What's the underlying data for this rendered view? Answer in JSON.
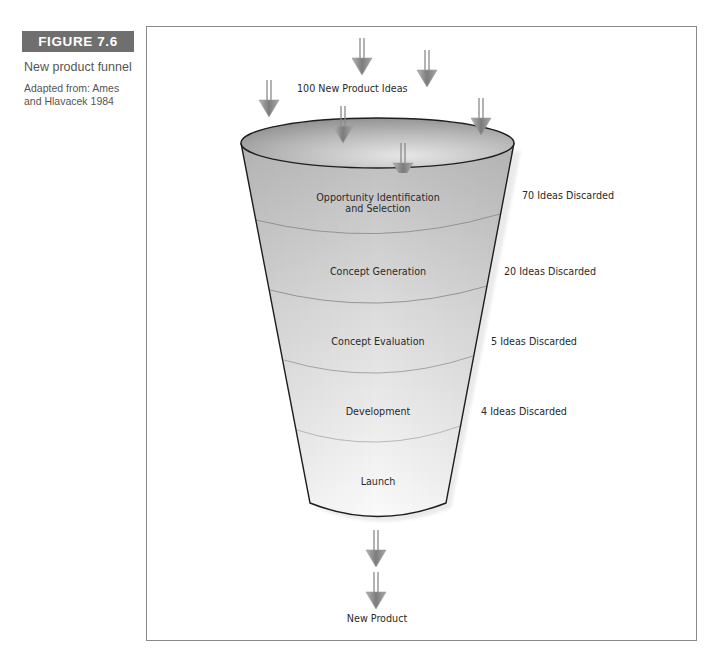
{
  "figure": {
    "label": "FIGURE 7.6",
    "caption": "New product funnel",
    "source": "Adapted from: Ames and Hlavacek 1984"
  },
  "diagram": {
    "type": "funnel",
    "input_label": "100 New Product Ideas",
    "output_label": "New Product",
    "stages": [
      {
        "name": "Opportunity Identification",
        "name_line2": "and Selection",
        "discarded": "70 Ideas Discarded"
      },
      {
        "name": "Concept Generation",
        "discarded": "20 Ideas Discarded"
      },
      {
        "name": "Concept Evaluation",
        "discarded": "5 Ideas Discarded"
      },
      {
        "name": "Development",
        "discarded": "4 Ideas Discarded"
      },
      {
        "name": "Launch"
      }
    ],
    "input_arrow_count": 6,
    "output_arrow_count": 2,
    "colors": {
      "label_bg": "#6f6f6f",
      "funnel_top": "#bdbdbd",
      "funnel_bottom": "#fafafa",
      "outline": "#1e1e1e",
      "divider": "#8c8c8c",
      "arrow": "#8a8a8a"
    }
  }
}
